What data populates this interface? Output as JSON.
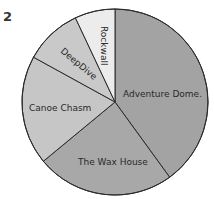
{
  "figure_number": "2",
  "chart_data": {
    "type": "pie",
    "title": "",
    "start_angle_deg": 0,
    "direction": "clockwise",
    "slices": [
      {
        "label": "Adventure Dome.",
        "value": 40,
        "color": "#a3a3a3"
      },
      {
        "label": "The Wax House",
        "value": 24,
        "color": "#a8a8a8"
      },
      {
        "label": "Canoe Chasm",
        "value": 19,
        "color": "#c6c6c6"
      },
      {
        "label": "DeepDive",
        "value": 10,
        "color": "#c9c9c9"
      },
      {
        "label": "Rockwall",
        "value": 7,
        "color": "#ececec"
      }
    ]
  }
}
